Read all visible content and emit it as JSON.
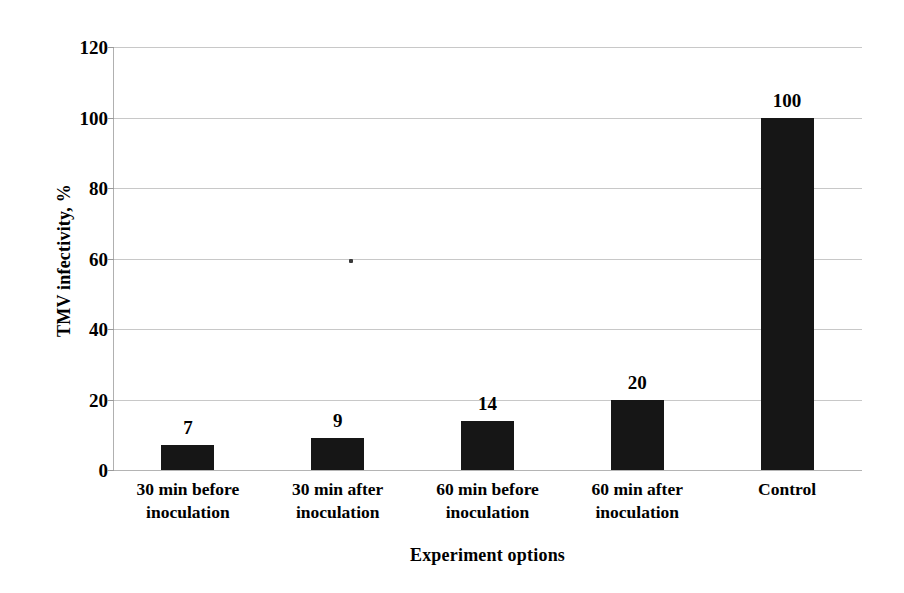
{
  "chart_data": {
    "type": "bar",
    "title": "",
    "subtitle": "",
    "xlabel": "Experiment options",
    "ylabel": "TMV infectivity, %",
    "categories": [
      "30 min before inoculation",
      "30 min after inoculation",
      "60 min before inoculation",
      "60 min after inoculation",
      "Control"
    ],
    "category_lines": [
      [
        "30 min before",
        "inoculation"
      ],
      [
        "30 min after",
        "inoculation"
      ],
      [
        "60 min before",
        "inoculation"
      ],
      [
        "60 min after",
        "inoculation"
      ],
      [
        "Control",
        ""
      ]
    ],
    "values": [
      7,
      9,
      14,
      20,
      100
    ],
    "data_labels": [
      "7",
      "9",
      "14",
      "20",
      "100"
    ],
    "ylim": [
      0,
      120
    ],
    "ytick_labels": [
      "0",
      "20",
      "40",
      "60",
      "80",
      "100",
      "120"
    ],
    "ytick_values": [
      0,
      20,
      40,
      60,
      80,
      100,
      120
    ],
    "grid": true,
    "grid_axis": "y",
    "legend": false,
    "legend_position": "none",
    "bar_color": "#161616",
    "grid_color": "#c8c8c8",
    "axis_color": "#b0b0b0",
    "background_color": "#ffffff",
    "text_color": "#000000"
  }
}
